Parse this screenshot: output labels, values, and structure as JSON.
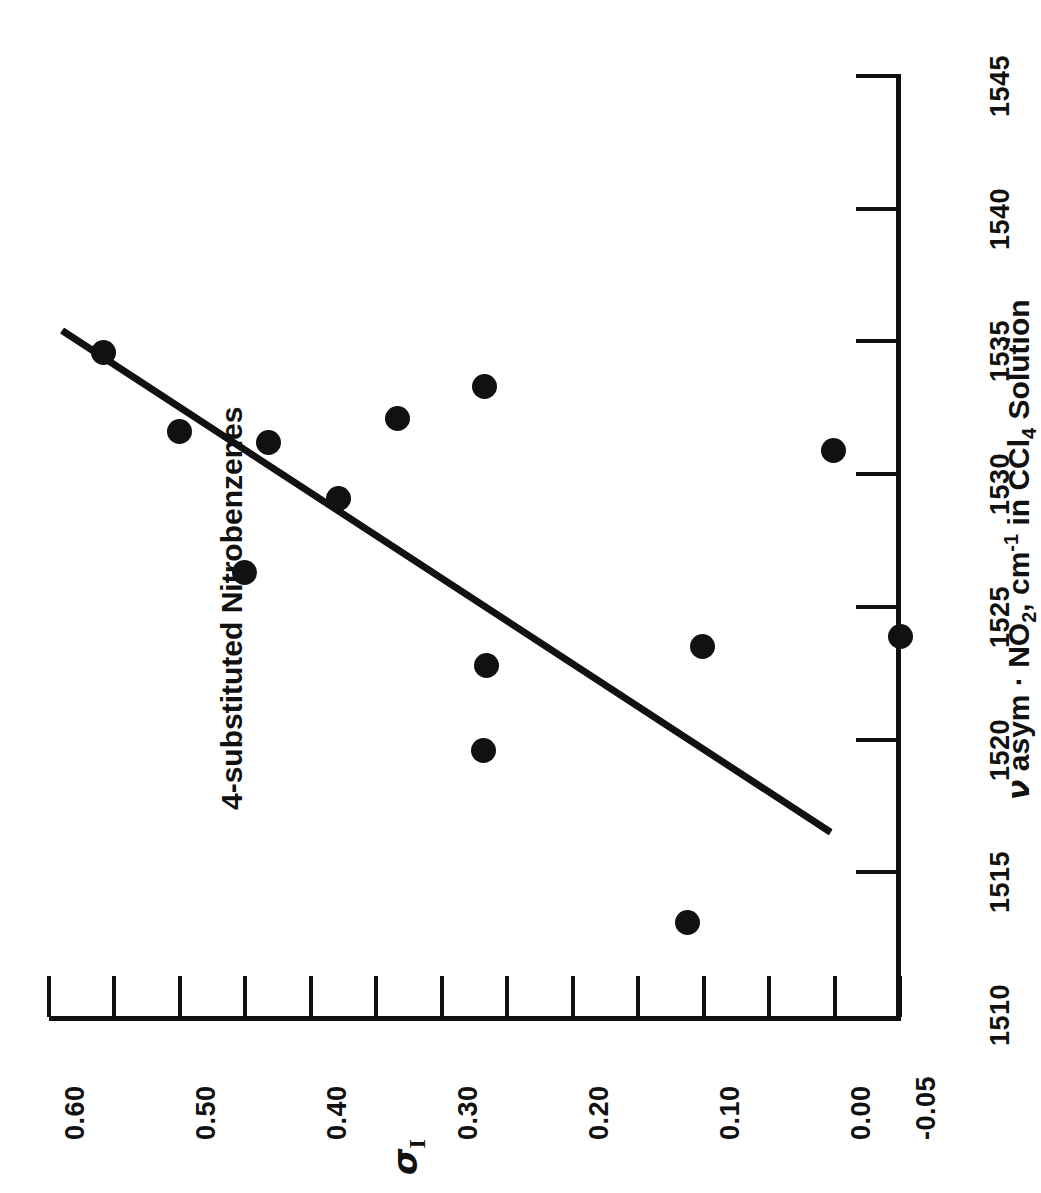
{
  "chart_data": {
    "type": "scatter",
    "title": "4-substituted Nitrobenzenes",
    "xlabel": "ν asym · NO2, cm-1 in CCl4 Solution",
    "xlabel_parts": {
      "nu": "ν",
      "mid": " asym · NO",
      "sub1": "2",
      "mid2": ", cm",
      "sup1": "-1",
      "tail": " in CCl",
      "sub2": "4",
      "end": " Solution"
    },
    "ylabel": "σI",
    "ylabel_parts": {
      "symbol": "σ",
      "subscript": "I"
    },
    "xlim": [
      1510,
      1545
    ],
    "ylim": [
      -0.05,
      0.6
    ],
    "xticks_major": [
      1510,
      1515,
      1520,
      1525,
      1530,
      1535,
      1540,
      1545
    ],
    "xtick_labels": [
      "1510",
      "1515",
      "1520",
      "1525",
      "1530",
      "1535",
      "1540",
      "1545"
    ],
    "xtick_minor_step": 5,
    "yticks_major": [
      0.6,
      0.5,
      0.4,
      0.3,
      0.2,
      0.1,
      0.0,
      -0.05
    ],
    "ytick_labels": [
      "0.60",
      "0.50",
      "0.40",
      "0.30",
      "0.20",
      "0.10",
      "0.00",
      "-0.05"
    ],
    "ytick_minor_step": 0.05,
    "grid": false,
    "legend": null,
    "orientation": "page rotated 90 degrees clockwise; x axis (nu) vertical at right, y axis (sigma I) horizontal at bottom",
    "points": [
      {
        "x": 1534.6,
        "y": 0.558
      },
      {
        "x": 1531.6,
        "y": 0.5
      },
      {
        "x": 1531.2,
        "y": 0.432
      },
      {
        "x": 1529.1,
        "y": 0.379
      },
      {
        "x": 1526.3,
        "y": 0.451
      },
      {
        "x": 1533.3,
        "y": 0.267
      },
      {
        "x": 1532.1,
        "y": 0.334
      },
      {
        "x": 1530.9,
        "y": 0.001
      },
      {
        "x": 1523.9,
        "y": -0.05
      },
      {
        "x": 1523.5,
        "y": 0.101
      },
      {
        "x": 1522.8,
        "y": 0.266
      },
      {
        "x": 1519.6,
        "y": 0.268
      },
      {
        "x": 1513.1,
        "y": 0.112
      }
    ],
    "fit_line": {
      "x0": 1535.4,
      "y0": 0.59,
      "x1": 1516.5,
      "y1": 0.003
    },
    "series_color": "#111111",
    "line_color": "#111111",
    "background": "#ffffff"
  }
}
